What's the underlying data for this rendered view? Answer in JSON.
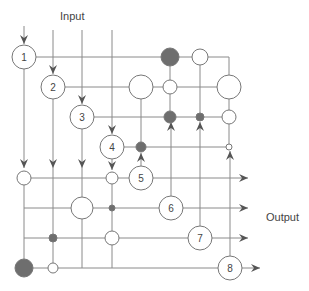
{
  "labels": {
    "input": "Input",
    "output": "Output"
  },
  "colors": {
    "line": "#8a8a8a",
    "node_stroke": "#777777",
    "dark_fill": "#6e6e6e",
    "light_fill": "#ffffff"
  },
  "processors": [
    {
      "id": "1",
      "label": "1",
      "x": 24,
      "y": 57
    },
    {
      "id": "2",
      "label": "2",
      "x": 53,
      "y": 87
    },
    {
      "id": "3",
      "label": "3",
      "x": 82,
      "y": 117
    },
    {
      "id": "4",
      "label": "4",
      "x": 112,
      "y": 147
    },
    {
      "id": "5",
      "label": "5",
      "x": 141,
      "y": 178
    },
    {
      "id": "6",
      "label": "6",
      "x": 171,
      "y": 208
    },
    {
      "id": "7",
      "label": "7",
      "x": 200,
      "y": 238
    },
    {
      "id": "8",
      "label": "8",
      "x": 230,
      "y": 268
    }
  ],
  "junctions": [
    {
      "x": 170,
      "y": 57,
      "r": 9,
      "dark": true
    },
    {
      "x": 200,
      "y": 57,
      "r": 8,
      "dark": false
    },
    {
      "x": 141,
      "y": 87,
      "r": 12,
      "dark": false
    },
    {
      "x": 170,
      "y": 87,
      "r": 7,
      "dark": false
    },
    {
      "x": 229,
      "y": 87,
      "r": 12,
      "dark": false
    },
    {
      "x": 170,
      "y": 117,
      "r": 6,
      "dark": true
    },
    {
      "x": 200,
      "y": 117,
      "r": 4,
      "dark": true
    },
    {
      "x": 229,
      "y": 117,
      "r": 7,
      "dark": false
    },
    {
      "x": 141,
      "y": 147,
      "r": 5,
      "dark": true
    },
    {
      "x": 229,
      "y": 147,
      "r": 3,
      "dark": false
    },
    {
      "x": 24,
      "y": 178,
      "r": 7,
      "dark": false
    },
    {
      "x": 112,
      "y": 178,
      "r": 6,
      "dark": false
    },
    {
      "x": 82,
      "y": 208,
      "r": 11,
      "dark": false
    },
    {
      "x": 112,
      "y": 208,
      "r": 3,
      "dark": true
    },
    {
      "x": 53,
      "y": 238,
      "r": 4,
      "dark": true
    },
    {
      "x": 112,
      "y": 238,
      "r": 7,
      "dark": false
    },
    {
      "x": 24,
      "y": 268,
      "r": 9,
      "dark": true
    },
    {
      "x": 53,
      "y": 268,
      "r": 5,
      "dark": false
    }
  ]
}
